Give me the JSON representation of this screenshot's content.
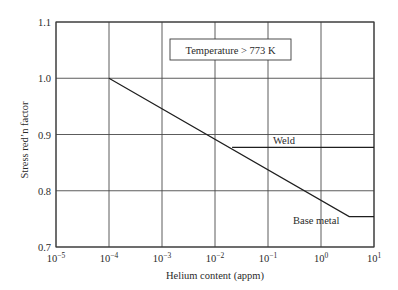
{
  "chart_data": {
    "type": "line",
    "title": "",
    "xlabel": "Helium content (appm)",
    "ylabel": "Stress red’n factor",
    "xscale": "log",
    "xlim_exp": [
      -5,
      1
    ],
    "ylim": [
      0.7,
      1.1
    ],
    "grid": true,
    "x_tick_exponents": [
      -5,
      -4,
      -3,
      -2,
      -1,
      0,
      1
    ],
    "x_tick_labels": [
      {
        "base": "10",
        "exp": "−5"
      },
      {
        "base": "10",
        "exp": "−4"
      },
      {
        "base": "10",
        "exp": "−3"
      },
      {
        "base": "10",
        "exp": "−2"
      },
      {
        "base": "10",
        "exp": "−1"
      },
      {
        "base": "10",
        "exp": "0"
      },
      {
        "base": "10",
        "exp": "1"
      }
    ],
    "y_ticks": [
      0.7,
      0.8,
      0.9,
      1.0,
      1.1
    ],
    "y_tick_labels": [
      "0.7",
      "0.8",
      "0.9",
      "1.0",
      "1.1"
    ],
    "series": [
      {
        "name": "Base metal",
        "x": [
          0.0001,
          3.4,
          10
        ],
        "y": [
          1.0,
          0.754,
          0.754
        ]
      },
      {
        "name": "Weld",
        "x": [
          0.021,
          10
        ],
        "y": [
          0.877,
          0.877
        ]
      }
    ],
    "annotations": [
      {
        "text": "Temperature > 773 K",
        "boxed": true,
        "position": "top-center"
      },
      {
        "text": "Weld",
        "labels_series": "Weld"
      },
      {
        "text": "Base metal",
        "labels_series": "Base metal"
      }
    ]
  }
}
